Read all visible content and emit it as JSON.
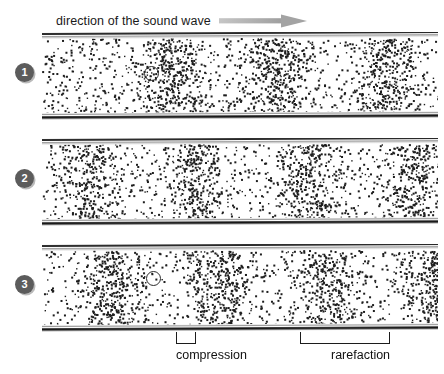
{
  "header": {
    "label": "direction of the sound wave",
    "arrow_icon": "right-arrow-icon",
    "arrow_color": "#a8a8a8"
  },
  "panels": [
    {
      "number": "1",
      "bands": [
        128,
        235,
        345
      ],
      "tracer": {
        "x": 150,
        "y": 72
      },
      "has_tracer": true
    },
    {
      "number": "2",
      "bands": [
        48,
        155,
        265,
        373
      ],
      "has_tracer": false
    },
    {
      "number": "3",
      "bands": [
        70,
        178,
        285,
        390
      ],
      "tracer": {
        "x": 152,
        "y": 277
      },
      "has_tracer": true
    }
  ],
  "annotations": [
    {
      "label": "compression",
      "bracket_left": 176,
      "bracket_right": 196,
      "label_x": 176,
      "label_y": 348
    },
    {
      "label": "rarefaction",
      "bracket_left": 300,
      "bracket_right": 390,
      "label_x": 331,
      "label_y": 348
    }
  ],
  "colors": {
    "particle": "#1e1e1e",
    "tube_wall_dark": "#161616",
    "tube_wall_light": "#b4b4b4",
    "badge_fill": "#5c5c5c",
    "badge_text": "#ffffff",
    "background": "#ffffff"
  },
  "geometry": {
    "tube_left": 42,
    "tube_width": 396,
    "panel_tops": [
      32,
      138,
      244
    ],
    "panel_height": 88
  }
}
